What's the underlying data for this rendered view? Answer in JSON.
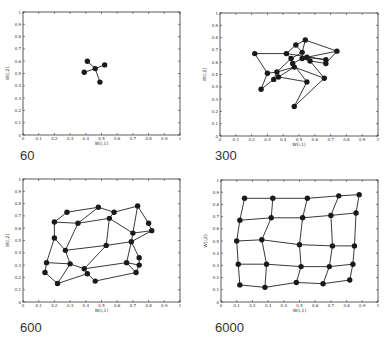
{
  "chart_data": [
    {
      "type": "scatter",
      "title": "",
      "caption": "60",
      "xlabel": "W(i,1)",
      "ylabel": "W(i,2)",
      "xlim": [
        0,
        1
      ],
      "ylim": [
        0,
        1
      ],
      "xticks": [
        "0",
        "0.1",
        "0.2",
        "0.3",
        "0.4",
        "0.5",
        "0.6",
        "0.7",
        "0.8",
        "0.9",
        "1"
      ],
      "yticks": [
        "0",
        "0.1",
        "0.2",
        "0.3",
        "0.4",
        "0.5",
        "0.6",
        "0.7",
        "0.8",
        "0.9",
        "1"
      ],
      "grid": false,
      "nodes": [
        [
          0.46,
          0.54
        ],
        [
          0.41,
          0.6
        ],
        [
          0.52,
          0.57
        ],
        [
          0.39,
          0.51
        ],
        [
          0.49,
          0.43
        ]
      ],
      "edges": [
        [
          0,
          1
        ],
        [
          0,
          2
        ],
        [
          0,
          3
        ],
        [
          0,
          4
        ]
      ]
    },
    {
      "type": "scatter",
      "title": "",
      "caption": "300",
      "xlabel": "W(i,1)",
      "ylabel": "W(i,2)",
      "xlim": [
        0,
        1
      ],
      "ylim": [
        0,
        1
      ],
      "xticks": [
        "0",
        "0.1",
        "0.2",
        "0.3",
        "0.4",
        "0.5",
        "0.6",
        "0.7",
        "0.8",
        "0.9",
        "1"
      ],
      "yticks": [
        "0",
        "0.1",
        "0.2",
        "0.3",
        "0.4",
        "0.5",
        "0.6",
        "0.7",
        "0.8",
        "0.9",
        "1"
      ],
      "grid": false,
      "nodes": [
        [
          0.22,
          0.67
        ],
        [
          0.42,
          0.67
        ],
        [
          0.48,
          0.74
        ],
        [
          0.54,
          0.78
        ],
        [
          0.74,
          0.69
        ],
        [
          0.52,
          0.68
        ],
        [
          0.45,
          0.63
        ],
        [
          0.55,
          0.64
        ],
        [
          0.52,
          0.63
        ],
        [
          0.57,
          0.61
        ],
        [
          0.67,
          0.62
        ],
        [
          0.67,
          0.59
        ],
        [
          0.46,
          0.59
        ],
        [
          0.47,
          0.56
        ],
        [
          0.3,
          0.51
        ],
        [
          0.36,
          0.52
        ],
        [
          0.37,
          0.48
        ],
        [
          0.34,
          0.46
        ],
        [
          0.26,
          0.38
        ],
        [
          0.55,
          0.44
        ],
        [
          0.66,
          0.47
        ],
        [
          0.47,
          0.24
        ]
      ],
      "edges": [
        [
          0,
          1
        ],
        [
          0,
          14
        ],
        [
          14,
          18
        ],
        [
          18,
          17
        ],
        [
          1,
          2
        ],
        [
          2,
          3
        ],
        [
          3,
          4
        ],
        [
          4,
          7
        ],
        [
          4,
          11
        ],
        [
          1,
          6
        ],
        [
          2,
          5
        ],
        [
          5,
          6
        ],
        [
          5,
          8
        ],
        [
          6,
          12
        ],
        [
          6,
          15
        ],
        [
          7,
          9
        ],
        [
          7,
          10
        ],
        [
          8,
          9
        ],
        [
          9,
          11
        ],
        [
          10,
          11
        ],
        [
          10,
          1
        ],
        [
          12,
          13
        ],
        [
          13,
          15
        ],
        [
          13,
          16
        ],
        [
          13,
          20
        ],
        [
          12,
          19
        ],
        [
          15,
          17
        ],
        [
          16,
          17
        ],
        [
          16,
          19
        ],
        [
          14,
          15
        ],
        [
          19,
          21
        ],
        [
          20,
          21
        ],
        [
          20,
          9
        ],
        [
          8,
          12
        ],
        [
          3,
          5
        ]
      ]
    },
    {
      "type": "scatter",
      "title": "",
      "caption": "600",
      "xlabel": "W(i,1)",
      "ylabel": "W(i,2)",
      "xlim": [
        0,
        1
      ],
      "ylim": [
        0,
        1
      ],
      "xticks": [
        "0",
        "0.1",
        "0.2",
        "0.3",
        "0.4",
        "0.5",
        "0.6",
        "0.7",
        "0.8",
        "0.9",
        "1"
      ],
      "yticks": [
        "0",
        "0.1",
        "0.2",
        "0.3",
        "0.4",
        "0.5",
        "0.6",
        "0.7",
        "0.8",
        "0.9",
        "1"
      ],
      "grid": false,
      "nodes": [
        [
          0.28,
          0.73
        ],
        [
          0.48,
          0.77
        ],
        [
          0.58,
          0.73
        ],
        [
          0.73,
          0.78
        ],
        [
          0.2,
          0.65
        ],
        [
          0.35,
          0.64
        ],
        [
          0.55,
          0.68
        ],
        [
          0.8,
          0.64
        ],
        [
          0.82,
          0.58
        ],
        [
          0.7,
          0.56
        ],
        [
          0.2,
          0.52
        ],
        [
          0.27,
          0.42
        ],
        [
          0.53,
          0.46
        ],
        [
          0.69,
          0.49
        ],
        [
          0.74,
          0.36
        ],
        [
          0.15,
          0.32
        ],
        [
          0.3,
          0.31
        ],
        [
          0.39,
          0.27
        ],
        [
          0.66,
          0.32
        ],
        [
          0.74,
          0.3
        ],
        [
          0.14,
          0.24
        ],
        [
          0.41,
          0.23
        ],
        [
          0.46,
          0.17
        ],
        [
          0.72,
          0.24
        ],
        [
          0.22,
          0.15
        ]
      ],
      "edges": [
        [
          0,
          1
        ],
        [
          1,
          2
        ],
        [
          2,
          3
        ],
        [
          0,
          4
        ],
        [
          1,
          5
        ],
        [
          2,
          6
        ],
        [
          3,
          7
        ],
        [
          3,
          9
        ],
        [
          7,
          8
        ],
        [
          4,
          5
        ],
        [
          5,
          6
        ],
        [
          6,
          9
        ],
        [
          9,
          8
        ],
        [
          8,
          13
        ],
        [
          4,
          10
        ],
        [
          5,
          11
        ],
        [
          6,
          12
        ],
        [
          9,
          13
        ],
        [
          10,
          11
        ],
        [
          11,
          12
        ],
        [
          12,
          13
        ],
        [
          13,
          14
        ],
        [
          10,
          15
        ],
        [
          11,
          16
        ],
        [
          12,
          17
        ],
        [
          13,
          18
        ],
        [
          15,
          16
        ],
        [
          16,
          17
        ],
        [
          17,
          18
        ],
        [
          18,
          19
        ],
        [
          14,
          19
        ],
        [
          15,
          20
        ],
        [
          16,
          24
        ],
        [
          17,
          21
        ],
        [
          18,
          23
        ],
        [
          19,
          23
        ],
        [
          20,
          24
        ],
        [
          24,
          21
        ],
        [
          21,
          22
        ],
        [
          22,
          23
        ]
      ]
    },
    {
      "type": "scatter",
      "title": "",
      "caption": "6000",
      "xlabel": "W(i,1)",
      "ylabel": "W(i,2)",
      "xlim": [
        0,
        1
      ],
      "ylim": [
        0,
        1
      ],
      "xticks": [
        "0",
        "0.1",
        "0.2",
        "0.3",
        "0.4",
        "0.5",
        "0.6",
        "0.7",
        "0.8",
        "0.9",
        "1"
      ],
      "yticks": [
        "0",
        "0.1",
        "0.2",
        "0.3",
        "0.4",
        "0.5",
        "0.6",
        "0.7",
        "0.8",
        "0.9",
        "1"
      ],
      "grid": false,
      "nodes": [
        [
          0.15,
          0.85
        ],
        [
          0.33,
          0.85
        ],
        [
          0.55,
          0.85
        ],
        [
          0.75,
          0.87
        ],
        [
          0.88,
          0.88
        ],
        [
          0.12,
          0.67
        ],
        [
          0.32,
          0.69
        ],
        [
          0.52,
          0.69
        ],
        [
          0.7,
          0.71
        ],
        [
          0.86,
          0.73
        ],
        [
          0.1,
          0.5
        ],
        [
          0.26,
          0.51
        ],
        [
          0.5,
          0.47
        ],
        [
          0.71,
          0.46
        ],
        [
          0.85,
          0.46
        ],
        [
          0.11,
          0.31
        ],
        [
          0.29,
          0.31
        ],
        [
          0.51,
          0.29
        ],
        [
          0.69,
          0.29
        ],
        [
          0.84,
          0.31
        ],
        [
          0.12,
          0.14
        ],
        [
          0.28,
          0.12
        ],
        [
          0.48,
          0.16
        ],
        [
          0.65,
          0.15
        ],
        [
          0.82,
          0.18
        ]
      ],
      "edges": "grid5x5"
    }
  ],
  "panels": [
    {
      "caption": "60"
    },
    {
      "caption": "300"
    },
    {
      "caption": "600"
    },
    {
      "caption": "6000"
    }
  ],
  "axes": {
    "xlabel": "W(i,1)",
    "ylabel": "W(i,2)"
  },
  "style": {
    "line_color": "#222222",
    "node_color": "#1a1a1a",
    "axis_color": "#333333"
  }
}
